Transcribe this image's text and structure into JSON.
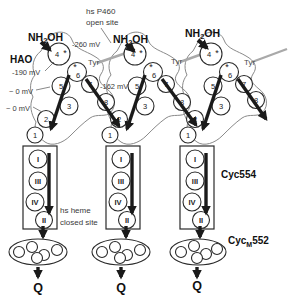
{
  "labels": {
    "open_site": [
      "hs P460",
      "open site"
    ],
    "hao": "HAO",
    "closed_site": [
      "hs heme",
      "closed site"
    ],
    "cyc554": "Cyc554",
    "cycm552": {
      "pre": "Cyc",
      "sub": "M",
      "post": "552"
    },
    "tyr": "Tyr",
    "quinone": "Q",
    "substrate": {
      "pre": "NH",
      "sub": "2",
      "post": "OH"
    },
    "asterisk": "*"
  },
  "potentials": {
    "p260": "-260 mV",
    "p190": "-190 mV",
    "p0a": "~ 0 mV",
    "p0b": "~ 0 mV",
    "p162": "-162 mV"
  },
  "hemes": {
    "h1": "1",
    "h2": "2",
    "h3": "3",
    "h4": "4",
    "h5": "5",
    "h6": "6",
    "h7": "7",
    "h8": "8"
  },
  "cyc_hemes": {
    "r1": "I",
    "r2": "III",
    "r3": "IV",
    "r4": "II"
  },
  "colors": {
    "ink": "#1a1a1a",
    "tyr_link": "#a9a9a9",
    "blob_outline": "#8a8a8a"
  }
}
